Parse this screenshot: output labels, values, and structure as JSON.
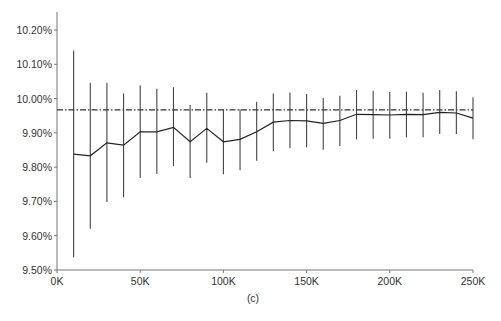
{
  "chart_data": {
    "type": "line",
    "title": "",
    "caption": "(c)",
    "xlabel": "",
    "ylabel": "",
    "xlim": [
      0,
      250000
    ],
    "ylim": [
      9.5,
      10.2
    ],
    "grid": false,
    "legend": null,
    "x_ticks": [
      0,
      50000,
      100000,
      150000,
      200000,
      250000
    ],
    "x_tick_labels": [
      "0K",
      "50K",
      "100K",
      "150K",
      "200K",
      "250K"
    ],
    "y_ticks": [
      9.5,
      9.6,
      9.7,
      9.8,
      9.9,
      10.0,
      10.1,
      10.2
    ],
    "y_tick_labels": [
      "9.50%",
      "9.60%",
      "9.70%",
      "9.80%",
      "9.90%",
      "10.00%",
      "10.10%",
      "10.20%"
    ],
    "reference_line": {
      "value": 9.967,
      "style": "dash-dot",
      "color": "#333333"
    },
    "series": [
      {
        "name": "estimate",
        "color": "#222222",
        "x": [
          10000,
          20000,
          30000,
          40000,
          50000,
          60000,
          70000,
          80000,
          90000,
          100000,
          110000,
          120000,
          130000,
          140000,
          150000,
          160000,
          170000,
          180000,
          190000,
          200000,
          210000,
          220000,
          230000,
          240000,
          250000
        ],
        "values": [
          9.838,
          9.833,
          9.871,
          9.864,
          9.903,
          9.903,
          9.916,
          9.874,
          9.913,
          9.874,
          9.881,
          9.903,
          9.931,
          9.936,
          9.935,
          9.928,
          9.936,
          9.954,
          9.953,
          9.952,
          9.954,
          9.953,
          9.96,
          9.958,
          9.943
        ],
        "upper": [
          10.14,
          10.046,
          10.046,
          10.015,
          10.039,
          10.029,
          10.033,
          9.981,
          10.017,
          9.969,
          9.969,
          9.991,
          10.015,
          10.018,
          10.013,
          10.002,
          10.008,
          10.025,
          10.023,
          10.019,
          10.02,
          10.017,
          10.025,
          10.021,
          10.004
        ],
        "lower": [
          9.537,
          9.62,
          9.698,
          9.712,
          9.768,
          9.78,
          9.803,
          9.768,
          9.813,
          9.779,
          9.791,
          9.819,
          9.847,
          9.855,
          9.858,
          9.851,
          9.862,
          9.881,
          9.883,
          9.883,
          9.887,
          9.887,
          9.897,
          9.897,
          9.881
        ]
      }
    ]
  },
  "layout": {
    "plot_left": 57,
    "plot_right": 473,
    "plot_top": 30,
    "plot_bottom": 270,
    "axis_top": 12
  }
}
